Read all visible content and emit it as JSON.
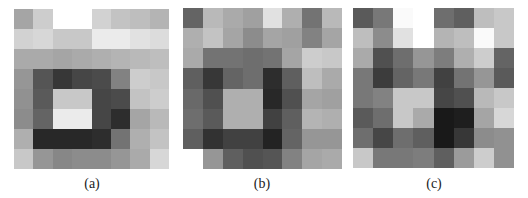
{
  "figure": {
    "panels": [
      {
        "id": "a",
        "label": "(a)",
        "cells": [
          [
            165,
            205,
            255,
            255,
            210,
            195,
            190,
            180
          ],
          [
            210,
            215,
            200,
            200,
            235,
            235,
            225,
            220
          ],
          [
            170,
            170,
            165,
            170,
            175,
            180,
            185,
            190
          ],
          [
            150,
            85,
            55,
            70,
            75,
            130,
            205,
            200
          ],
          [
            145,
            90,
            200,
            200,
            70,
            75,
            195,
            205
          ],
          [
            140,
            100,
            235,
            235,
            70,
            45,
            165,
            185
          ],
          [
            175,
            40,
            40,
            40,
            45,
            115,
            175,
            195
          ],
          [
            200,
            150,
            135,
            140,
            140,
            150,
            170,
            215
          ]
        ]
      },
      {
        "id": "b",
        "label": "(b)",
        "cells": [
          [
            100,
            185,
            170,
            160,
            225,
            175,
            115,
            185
          ],
          [
            175,
            195,
            165,
            140,
            165,
            160,
            130,
            165
          ],
          [
            170,
            115,
            115,
            110,
            115,
            165,
            205,
            200
          ],
          [
            95,
            55,
            100,
            110,
            45,
            95,
            190,
            170
          ],
          [
            105,
            80,
            175,
            175,
            40,
            80,
            165,
            160
          ],
          [
            110,
            90,
            175,
            175,
            65,
            95,
            180,
            175
          ],
          [
            95,
            50,
            65,
            65,
            35,
            100,
            150,
            150
          ],
          [
            255,
            150,
            95,
            80,
            85,
            130,
            165,
            170
          ]
        ]
      },
      {
        "id": "c",
        "label": "(c)",
        "cells": [
          [
            90,
            120,
            250,
            255,
            110,
            95,
            190,
            200
          ],
          [
            190,
            140,
            225,
            255,
            180,
            190,
            250,
            200
          ],
          [
            170,
            80,
            110,
            150,
            125,
            175,
            205,
            100
          ],
          [
            120,
            60,
            100,
            120,
            65,
            115,
            150,
            90
          ],
          [
            120,
            130,
            200,
            200,
            70,
            80,
            185,
            200
          ],
          [
            90,
            110,
            200,
            170,
            25,
            30,
            165,
            215
          ],
          [
            110,
            70,
            110,
            95,
            25,
            55,
            140,
            145
          ],
          [
            200,
            120,
            120,
            125,
            95,
            155,
            205,
            145
          ]
        ]
      }
    ]
  },
  "chart_data": [
    {
      "type": "heatmap",
      "title": "(a)",
      "rows": 8,
      "cols": 8,
      "colormap": "grayscale (0=black, 255=white)",
      "values": [
        [
          165,
          205,
          255,
          255,
          210,
          195,
          190,
          180
        ],
        [
          210,
          215,
          200,
          200,
          235,
          235,
          225,
          220
        ],
        [
          170,
          170,
          165,
          170,
          175,
          180,
          185,
          190
        ],
        [
          150,
          85,
          55,
          70,
          75,
          130,
          205,
          200
        ],
        [
          145,
          90,
          200,
          200,
          70,
          75,
          195,
          205
        ],
        [
          140,
          100,
          235,
          235,
          70,
          45,
          165,
          185
        ],
        [
          175,
          40,
          40,
          40,
          45,
          115,
          175,
          195
        ],
        [
          200,
          150,
          135,
          140,
          140,
          150,
          170,
          215
        ]
      ]
    },
    {
      "type": "heatmap",
      "title": "(b)",
      "rows": 8,
      "cols": 8,
      "colormap": "grayscale (0=black, 255=white)",
      "values": [
        [
          100,
          185,
          170,
          160,
          225,
          175,
          115,
          185
        ],
        [
          175,
          195,
          165,
          140,
          165,
          160,
          130,
          165
        ],
        [
          170,
          115,
          115,
          110,
          115,
          165,
          205,
          200
        ],
        [
          95,
          55,
          100,
          110,
          45,
          95,
          190,
          170
        ],
        [
          105,
          80,
          175,
          175,
          40,
          80,
          165,
          160
        ],
        [
          110,
          90,
          175,
          175,
          65,
          95,
          180,
          175
        ],
        [
          95,
          50,
          65,
          65,
          35,
          100,
          150,
          150
        ],
        [
          255,
          150,
          95,
          80,
          85,
          130,
          165,
          170
        ]
      ]
    },
    {
      "type": "heatmap",
      "title": "(c)",
      "rows": 8,
      "cols": 8,
      "colormap": "grayscale (0=black, 255=white)",
      "values": [
        [
          90,
          120,
          250,
          255,
          110,
          95,
          190,
          200
        ],
        [
          190,
          140,
          225,
          255,
          180,
          190,
          250,
          200
        ],
        [
          170,
          80,
          110,
          150,
          125,
          175,
          205,
          100
        ],
        [
          120,
          60,
          100,
          120,
          65,
          115,
          150,
          90
        ],
        [
          120,
          130,
          200,
          200,
          70,
          80,
          185,
          200
        ],
        [
          90,
          110,
          200,
          170,
          25,
          30,
          165,
          215
        ],
        [
          110,
          70,
          110,
          95,
          25,
          55,
          140,
          145
        ],
        [
          200,
          120,
          120,
          125,
          95,
          155,
          205,
          145
        ]
      ]
    }
  ]
}
